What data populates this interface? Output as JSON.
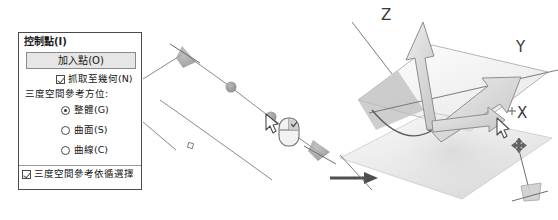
{
  "dialog": {
    "title": "控制點(I)",
    "add_point_button": "加入點(O)",
    "snap_checkbox": {
      "label": "抓取至幾何(N)",
      "checked": true
    },
    "reference_group_label": "三度空間參考方位:",
    "radios": [
      {
        "label": "整體(G)",
        "selected": true
      },
      {
        "label": "曲面(S)",
        "selected": false
      },
      {
        "label": "曲線(C)",
        "selected": false
      }
    ],
    "follow_checkbox": {
      "label": "三度空間參考依循選擇",
      "checked": true
    }
  },
  "diagram": {
    "axis_labels": {
      "z": "Z",
      "y": "Y",
      "x": "X"
    },
    "icons": {
      "mouse": "mouse-right-click-icon",
      "cursor": "arrow-cursor-icon",
      "move": "four-way-move-icon",
      "transition": "right-arrow-icon"
    },
    "colors": {
      "line": "#6e6e6e",
      "arrow_fill": "#d6d6d6",
      "arrow_stroke": "#8e8e8e",
      "plane_fill": "#e8e8e8",
      "point": "#6b6b6b",
      "ink": "#3a3a3a"
    }
  }
}
